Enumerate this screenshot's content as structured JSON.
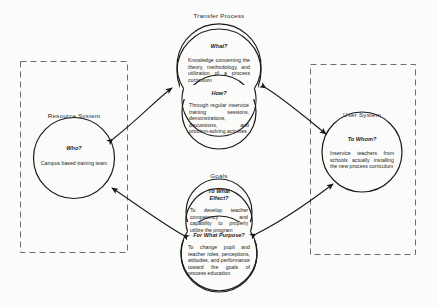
{
  "diagram": {
    "title_hidden": "",
    "systems": [
      {
        "id": "resource-system",
        "label": "Resource System",
        "question": "Who?",
        "body": "Campus based training team"
      },
      {
        "id": "transfer-process",
        "label": "Transfer Process",
        "blocks": [
          {
            "question": "What?",
            "body": "Knowledge concerning the theory, methodology, and utilization of a process curriculum"
          },
          {
            "question": "How?",
            "body": "Through regular inservice training sessions, demonstrations, discussions, and problem-solving activities"
          }
        ]
      },
      {
        "id": "user-system",
        "label": "User System",
        "question": "To Whom?",
        "body": "Inservice teachers from schools actually installing the new process curriculum"
      },
      {
        "id": "goals",
        "label": "Goals",
        "blocks": [
          {
            "question_line1": "To What",
            "question_line2": "Effect?",
            "body": "To develop teacher competency and capability to properly utilize the program"
          },
          {
            "question": "For What Purpose?",
            "body": "To change pupil and teacher roles, perceptions, attitudes, and performance toward the goals of process education"
          }
        ]
      }
    ],
    "colors": {
      "stroke": "#1a1a1a",
      "dashed": "#6d6d6d",
      "background": "#fbfbfa",
      "text": "#1c1c1c"
    }
  }
}
